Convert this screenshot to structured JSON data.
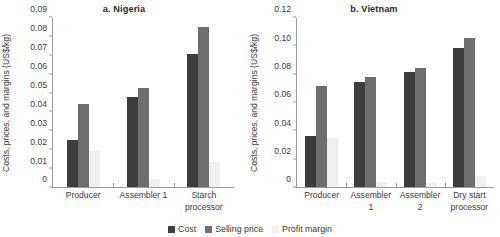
{
  "legend": {
    "items": [
      {
        "key": "cost",
        "label": "Cost",
        "color": "#3d3d3d"
      },
      {
        "key": "selling",
        "label": "Selling price",
        "color": "#6e6e6e"
      },
      {
        "key": "margin",
        "label": "Profit margin",
        "color": "#f0f0f0"
      }
    ]
  },
  "chart_data": [
    {
      "type": "bar",
      "panel": "a",
      "title": "a. Nigeria",
      "xlabel": "",
      "ylabel": "Costs, prices, and margins (US$/kg)",
      "ylim": [
        0,
        0.09
      ],
      "yticks": [
        "0",
        "0.01",
        "0.02",
        "0.03",
        "0.04",
        "0.05",
        "0.06",
        "0.07",
        "0.08",
        "0.09"
      ],
      "ytick_values": [
        0,
        0.01,
        0.02,
        0.03,
        0.04,
        0.05,
        0.06,
        0.07,
        0.08,
        0.09
      ],
      "grid": false,
      "legend_position": "bottom",
      "categories": [
        "Producer",
        "Assembler 1",
        "Starch processor"
      ],
      "series": [
        {
          "name": "Cost",
          "values": [
            0.025,
            0.048,
            0.071
          ]
        },
        {
          "name": "Selling price",
          "values": [
            0.044,
            0.0525,
            0.085
          ]
        },
        {
          "name": "Profit margin",
          "values": [
            0.019,
            0.0045,
            0.0135
          ]
        }
      ]
    },
    {
      "type": "bar",
      "panel": "b",
      "title": "b. Vietnam",
      "xlabel": "",
      "ylabel": "Costs, prices, and margins (US$/kg)",
      "ylim": [
        0,
        0.12
      ],
      "yticks": [
        "0",
        "0.02",
        "0.04",
        "0.06",
        "0.08",
        "0.10",
        "0.12"
      ],
      "ytick_values": [
        0,
        0.02,
        0.04,
        0.06,
        0.08,
        0.1,
        0.12
      ],
      "grid": false,
      "legend_position": "bottom",
      "categories": [
        "Producer",
        "Assembler 1",
        "Assembler 2",
        "Dry start processor"
      ],
      "series": [
        {
          "name": "Cost",
          "values": [
            0.036,
            0.0745,
            0.0815,
            0.0985
          ]
        },
        {
          "name": "Selling price",
          "values": [
            0.0715,
            0.078,
            0.0845,
            0.106
          ]
        },
        {
          "name": "Profit margin",
          "values": [
            0.035,
            0.0035,
            0.003,
            0.0075
          ]
        }
      ]
    }
  ]
}
